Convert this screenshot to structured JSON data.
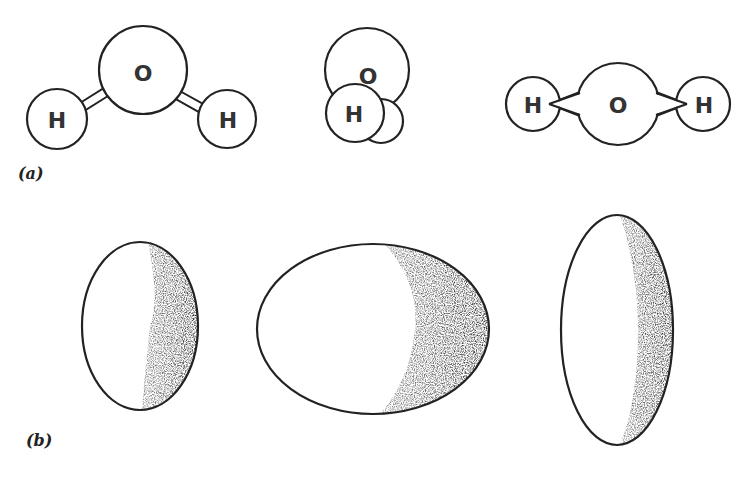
{
  "panels": {
    "a": {
      "label": "(a)",
      "molecules": [
        {
          "name": "bent-view",
          "atoms": [
            {
              "symbol": "O",
              "cx": 143,
              "cy": 70,
              "r": 44
            },
            {
              "symbol": "H",
              "cx": 57,
              "cy": 119,
              "r": 30
            },
            {
              "symbol": "H",
              "cx": 227,
              "cy": 119,
              "r": 29
            }
          ],
          "bond_style": "double-line"
        },
        {
          "name": "end-on-view",
          "atoms": [
            {
              "symbol": "O",
              "cx": 367,
              "cy": 70,
              "r": 42
            },
            {
              "symbol": "",
              "cx": 381,
              "cy": 121,
              "r": 22
            },
            {
              "symbol": "H",
              "cx": 355,
              "cy": 113,
              "r": 29
            }
          ]
        },
        {
          "name": "linear-view",
          "atoms": [
            {
              "symbol": "H",
              "cx": 533,
              "cy": 104,
              "r": 27
            },
            {
              "symbol": "O",
              "cx": 618,
              "cy": 104,
              "r": 41
            },
            {
              "symbol": "H",
              "cx": 703,
              "cy": 104,
              "r": 27
            }
          ],
          "bond_style": "wedge"
        }
      ]
    },
    "b": {
      "label": "(b)",
      "ellipsoids": [
        {
          "name": "narrow-ellipsoid",
          "cx": 140,
          "cy": 326,
          "rx": 58,
          "ry": 84
        },
        {
          "name": "wide-ellipsoid",
          "cx": 373,
          "cy": 329,
          "rx": 116,
          "ry": 85
        },
        {
          "name": "tall-ellipsoid",
          "cx": 617,
          "cy": 330,
          "rx": 56,
          "ry": 115
        }
      ]
    }
  },
  "colors": {
    "stroke": "#222222",
    "shade": "#1a1a1a",
    "background": "#ffffff"
  }
}
